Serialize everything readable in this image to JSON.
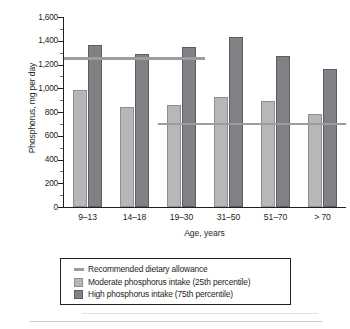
{
  "chart_data": {
    "type": "bar",
    "title": "",
    "xlabel": "Age, years",
    "ylabel": "Phosphorus, mg per day",
    "ylim": [
      0,
      1600
    ],
    "ytick_step": 200,
    "yticks": [
      "0",
      "200",
      "400",
      "600",
      "800",
      "1,000",
      "1,200",
      "1,400",
      "1,600"
    ],
    "ytick_values": [
      0,
      200,
      400,
      600,
      800,
      1000,
      1200,
      1400,
      1600
    ],
    "grid": false,
    "legend_position": "below-plot",
    "categories": [
      "9–13",
      "14–18",
      "19–30",
      "31–50",
      "51–70",
      "> 70"
    ],
    "series": [
      {
        "name": "Moderate phosphorus intake (25th percentile)",
        "color": "#b6b7b8",
        "values": [
          985,
          840,
          860,
          925,
          895,
          780
        ]
      },
      {
        "name": "High phosphorus intake (75th percentile)",
        "color": "#808184",
        "values": [
          1365,
          1290,
          1345,
          1435,
          1275,
          1160
        ]
      }
    ],
    "reference_lines": [
      {
        "name": "Recommended dietary allowance",
        "value": 1250,
        "color": "#9c9d9f",
        "spans_categories": [
          "9–13",
          "14–18",
          "19–30"
        ],
        "start_index": 0,
        "end_index": 2
      },
      {
        "name": "Recommended dietary allowance",
        "value": 700,
        "color": "#9c9d9f",
        "spans_categories": [
          "19–30",
          "31–50",
          "51–70",
          "> 70"
        ],
        "start_index": 2,
        "end_index": 5
      }
    ],
    "annotations": []
  },
  "axes": {
    "y_title": "Phosphorus, mg per day",
    "x_title": "Age, years"
  },
  "legend": {
    "items": [
      {
        "marker": "line",
        "label": "Recommended dietary allowance"
      },
      {
        "marker": "moderate",
        "label": "Moderate phosphorus intake (25th percentile)"
      },
      {
        "marker": "high",
        "label": "High phosphorus intake (75th percentile)"
      }
    ]
  },
  "colors": {
    "moderate": "#b6b7b8",
    "high": "#808184",
    "reference_line": "#9c9d9f",
    "axis": "#231f20",
    "background": "#ffffff"
  }
}
